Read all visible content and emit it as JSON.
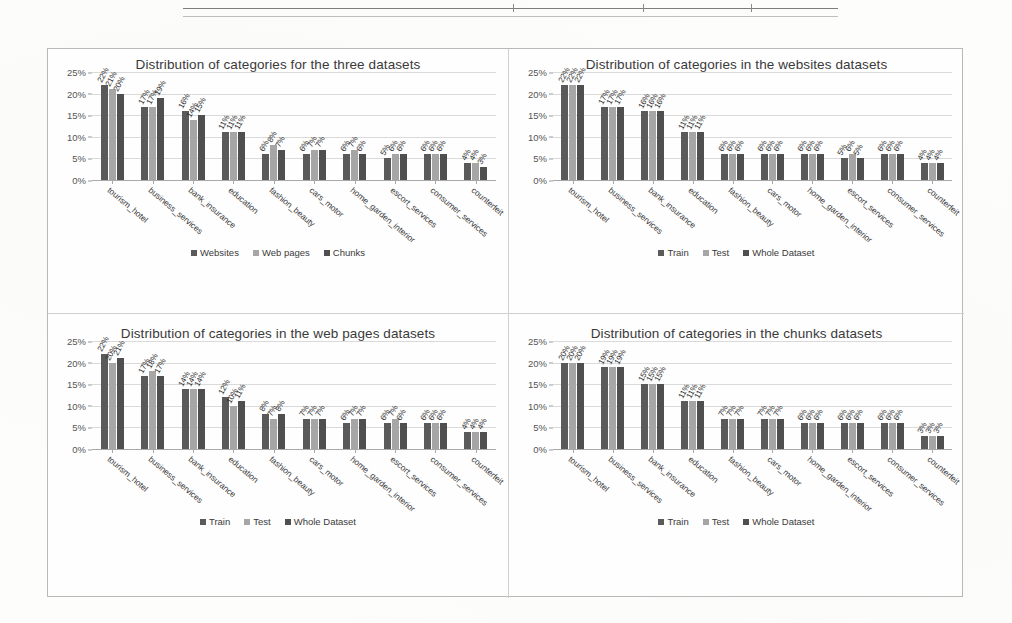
{
  "figure": {
    "categories": [
      "tourism_hotel",
      "business_services",
      "bank_insurance",
      "education",
      "fashion_beauty",
      "cars_motor",
      "home_garden_interior",
      "escort_services",
      "consumer_services",
      "counterfeit"
    ],
    "yticks": [
      "0%",
      "5%",
      "10%",
      "15%",
      "20%",
      "25%"
    ],
    "colors": {
      "series1": "#5a5a5a",
      "series2": "#a6a6a6",
      "series3": "#4f4f4f",
      "axis": "#a8a8a8",
      "grid": "#dadada"
    }
  },
  "chart_data": [
    {
      "id": "three-datasets",
      "type": "bar",
      "title": "Distribution of categories for the three datasets",
      "xlabel": "",
      "ylabel": "",
      "ylim": [
        0,
        25
      ],
      "grid": true,
      "legend_position": "bottom",
      "categories": [
        "tourism_hotel",
        "business_services",
        "bank_insurance",
        "education",
        "fashion_beauty",
        "cars_motor",
        "home_garden_interior",
        "escort_services",
        "consumer_services",
        "counterfeit"
      ],
      "ytick_labels": [
        "0%",
        "5%",
        "10%",
        "15%",
        "20%",
        "25%"
      ],
      "series": [
        {
          "name": "Websites",
          "values": [
            22,
            17,
            16,
            11,
            6,
            6,
            6,
            5,
            6,
            4
          ],
          "labels": [
            "22%",
            "17%",
            "16%",
            "11%",
            "6%",
            "6%",
            "6%",
            "5%",
            "6%",
            "4%"
          ]
        },
        {
          "name": "Web pages",
          "values": [
            21,
            17,
            14,
            11,
            8,
            7,
            7,
            6,
            6,
            4
          ],
          "labels": [
            "21%",
            "17%",
            "14%",
            "11%",
            "8%",
            "7%",
            "7%",
            "6%",
            "6%",
            "4%"
          ]
        },
        {
          "name": "Chunks",
          "values": [
            20,
            19,
            15,
            11,
            7,
            7,
            6,
            6,
            6,
            3
          ],
          "labels": [
            "20%",
            "19%",
            "15%",
            "11%",
            "7%",
            "7%",
            "6%",
            "6%",
            "6%",
            "3%"
          ]
        }
      ]
    },
    {
      "id": "websites-datasets",
      "type": "bar",
      "title": "Distribution of categories in the websites datasets",
      "xlabel": "",
      "ylabel": "",
      "ylim": [
        0,
        25
      ],
      "grid": true,
      "legend_position": "bottom",
      "categories": [
        "tourism_hotel",
        "business_services",
        "bank_insurance",
        "education",
        "fashion_beauty",
        "cars_motor",
        "home_garden_interior",
        "escort_services",
        "consumer_services",
        "counterfeit"
      ],
      "ytick_labels": [
        "0%",
        "5%",
        "10%",
        "15%",
        "20%",
        "25%"
      ],
      "series": [
        {
          "name": "Train",
          "values": [
            22,
            17,
            16,
            11,
            6,
            6,
            6,
            5,
            6,
            4
          ],
          "labels": [
            "22%",
            "17%",
            "16%",
            "11%",
            "6%",
            "6%",
            "6%",
            "5%",
            "6%",
            "4%"
          ]
        },
        {
          "name": "Test",
          "values": [
            22,
            17,
            16,
            11,
            6,
            6,
            6,
            6,
            6,
            4
          ],
          "labels": [
            "22%",
            "17%",
            "16%",
            "11%",
            "6%",
            "6%",
            "6%",
            "6%",
            "6%",
            "4%"
          ]
        },
        {
          "name": "Whole Dataset",
          "values": [
            22,
            17,
            16,
            11,
            6,
            6,
            6,
            5,
            6,
            4
          ],
          "labels": [
            "22%",
            "17%",
            "16%",
            "11%",
            "6%",
            "6%",
            "6%",
            "5%",
            "6%",
            "4%"
          ]
        }
      ]
    },
    {
      "id": "web-pages-datasets",
      "type": "bar",
      "title": "Distribution of categories in the web pages datasets",
      "xlabel": "",
      "ylabel": "",
      "ylim": [
        0,
        25
      ],
      "grid": true,
      "legend_position": "bottom",
      "categories": [
        "tourism_hotel",
        "business_services",
        "bank_insurance",
        "education",
        "fashion_beauty",
        "cars_motor",
        "home_garden_interior",
        "escort_services",
        "consumer_services",
        "counterfeit"
      ],
      "ytick_labels": [
        "0%",
        "5%",
        "10%",
        "15%",
        "20%",
        "25%"
      ],
      "series": [
        {
          "name": "Train",
          "values": [
            22,
            17,
            14,
            12,
            8,
            7,
            6,
            6,
            6,
            4
          ],
          "labels": [
            "22%",
            "17%",
            "14%",
            "12%",
            "8%",
            "7%",
            "6%",
            "6%",
            "6%",
            "4%"
          ]
        },
        {
          "name": "Test",
          "values": [
            20,
            18,
            14,
            10,
            7,
            7,
            7,
            7,
            6,
            4
          ],
          "labels": [
            "20%",
            "18%",
            "14%",
            "10%",
            "7%",
            "7%",
            "7%",
            "7%",
            "6%",
            "4%"
          ]
        },
        {
          "name": "Whole Dataset",
          "values": [
            21,
            17,
            14,
            11,
            8,
            7,
            7,
            6,
            6,
            4
          ],
          "labels": [
            "21%",
            "17%",
            "14%",
            "11%",
            "8%",
            "7%",
            "7%",
            "6%",
            "6%",
            "4%"
          ]
        }
      ]
    },
    {
      "id": "chunks-datasets",
      "type": "bar",
      "title": "Distribution of categories in the chunks datasets",
      "xlabel": "",
      "ylabel": "",
      "ylim": [
        0,
        25
      ],
      "grid": true,
      "legend_position": "bottom",
      "categories": [
        "tourism_hotel",
        "business_services",
        "bank_insurance",
        "education",
        "fashion_beauty",
        "cars_motor",
        "home_garden_interior",
        "escort_services",
        "consumer_services",
        "counterfeit"
      ],
      "ytick_labels": [
        "0%",
        "5%",
        "10%",
        "15%",
        "20%",
        "25%"
      ],
      "series": [
        {
          "name": "Train",
          "values": [
            20,
            19,
            15,
            11,
            7,
            7,
            6,
            6,
            6,
            3
          ],
          "labels": [
            "20%",
            "19%",
            "15%",
            "11%",
            "7%",
            "7%",
            "6%",
            "6%",
            "6%",
            "3%"
          ]
        },
        {
          "name": "Test",
          "values": [
            20,
            19,
            15,
            11,
            7,
            7,
            6,
            6,
            6,
            3
          ],
          "labels": [
            "20%",
            "19%",
            "15%",
            "11%",
            "7%",
            "7%",
            "6%",
            "6%",
            "6%",
            "3%"
          ]
        },
        {
          "name": "Whole Dataset",
          "values": [
            20,
            19,
            15,
            11,
            7,
            7,
            6,
            6,
            6,
            3
          ],
          "labels": [
            "20%",
            "19%",
            "15%",
            "11%",
            "7%",
            "7%",
            "6%",
            "6%",
            "6%",
            "3%"
          ]
        }
      ]
    }
  ]
}
